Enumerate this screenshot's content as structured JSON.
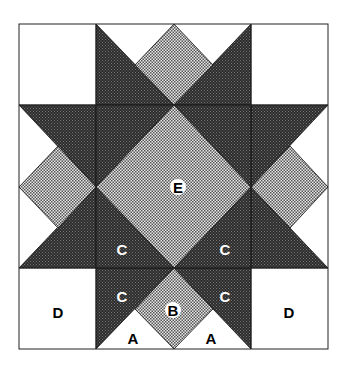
{
  "diagram": {
    "type": "quilt-block-piecing-diagram",
    "colors": {
      "background": "#ffffff",
      "dark_fabric": "#3a3a3a",
      "light_fabric": "#b8b8b8",
      "outline": "#222222"
    },
    "labels": {
      "E": "E",
      "C1": "C",
      "C2": "C",
      "C3": "C",
      "C4": "C",
      "B": "B",
      "A1": "A",
      "A2": "A",
      "D1": "D",
      "D2": "D"
    }
  }
}
